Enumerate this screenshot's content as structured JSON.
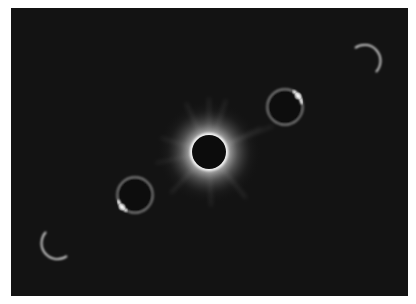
{
  "image": {
    "alt": "Composite photograph of a total solar eclipse sequence: crescent, diamond ring, totality with corona, diamond ring, crescent",
    "background_color": "#131313",
    "frame_color": "#ffffff"
  },
  "phases": [
    {
      "name": "partial-crescent-start",
      "cx": 352,
      "cy": 52
    },
    {
      "name": "diamond-ring-upper",
      "cx": 274,
      "cy": 99
    },
    {
      "name": "totality-corona",
      "cx": 198,
      "cy": 144
    },
    {
      "name": "diamond-ring-lower",
      "cx": 124,
      "cy": 187
    },
    {
      "name": "partial-crescent-end",
      "cx": 46,
      "cy": 235
    }
  ]
}
